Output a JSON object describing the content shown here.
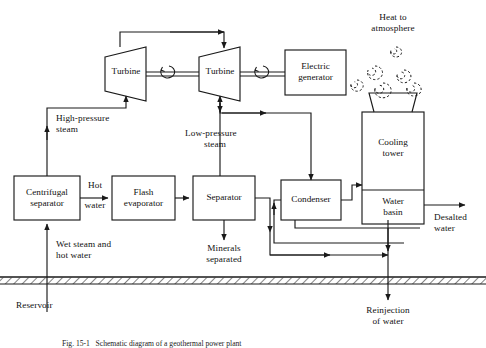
{
  "figure": {
    "caption": "Fig. 15-1   Schematic diagram of a geothermal power plant",
    "line_color": "#1a1a1a",
    "background": "#ffffff"
  },
  "nodes": {
    "turbine_hp": "Turbine",
    "turbine_lp": "Turbine",
    "generator": "Electric\ngenerator",
    "generator_line1": "Electric",
    "generator_line2": "generator",
    "cooling_tower": "Cooling\ntower",
    "cooling_tower_line1": "Cooling",
    "cooling_tower_line2": "tower",
    "water_basin": "Water\nbasin",
    "water_basin_line1": "Water",
    "water_basin_line2": "basin",
    "centrifugal_separator": "Centrifugal\nseparator",
    "centrifugal_separator_line1": "Centrifugal",
    "centrifugal_separator_line2": "separator",
    "flash_evaporator": "Flash\nevaporator",
    "flash_evaporator_line1": "Flash",
    "flash_evaporator_line2": "evaporator",
    "separator": "Separator",
    "condenser": "Condenser"
  },
  "stream_labels": {
    "heat_to_atmosphere_l1": "Heat to",
    "heat_to_atmosphere_l2": "atmosphere",
    "high_pressure_steam_l1": "High-pressure",
    "high_pressure_steam_l2": "steam",
    "low_pressure_steam_l1": "Low-pressure",
    "low_pressure_steam_l2": "steam",
    "hot_water_l1": "Hot",
    "hot_water_l2": "water",
    "wet_steam_l1": "Wet steam and",
    "wet_steam_l2": "hot water",
    "reservoir": "Reservoir",
    "minerals_l1": "Minerals",
    "minerals_l2": "separated",
    "desalted_l1": "Desalted",
    "desalted_l2": "water",
    "reinjection_l1": "Reinjection",
    "reinjection_l2": "of water"
  }
}
